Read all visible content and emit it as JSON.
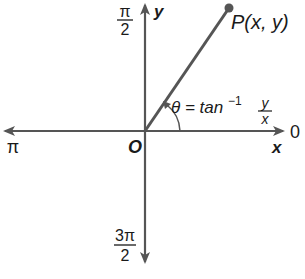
{
  "diagram": {
    "colors": {
      "axis": "#555555",
      "ray": "#555555",
      "point": "#555555",
      "text": "#1a1a1a"
    },
    "axes": {
      "x_label": "x",
      "y_label": "y",
      "origin_label": "O",
      "right_angle_label": "0",
      "left_angle_label": "π",
      "top_angle": {
        "numerator": "π",
        "denominator": "2"
      },
      "bottom_angle": {
        "numerator": "3π",
        "denominator": "2"
      }
    },
    "point": {
      "label": "P(x, y)"
    },
    "angle": {
      "lhs": "θ = tan",
      "exponent": "−1",
      "frac_num": "y",
      "frac_den": "x"
    }
  }
}
